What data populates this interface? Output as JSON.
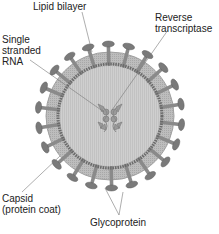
{
  "diagram": {
    "labels": {
      "lipid_bilayer": "Lipid bilayer",
      "reverse_transcriptase_1": "Reverse",
      "reverse_transcriptase_2": "transcriptase",
      "rna_1": "Single",
      "rna_2": "stranded",
      "rna_3": "RNA",
      "capsid_1": "Capsid",
      "capsid_2": "(protein coat)",
      "glycoprotein": "Glycoprotein"
    },
    "colors": {
      "core_fill": "#c8c8c8",
      "bilayer_fill": "#b9b9b9",
      "spike_fill": "#7a7a7a",
      "leader_line": "#777777"
    }
  }
}
